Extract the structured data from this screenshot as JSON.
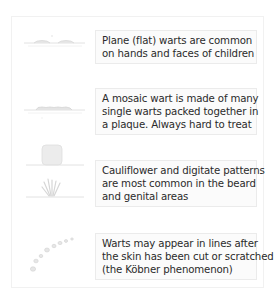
{
  "diagram": {
    "rows": [
      {
        "illustration": "plane-wart-icon",
        "lines": [
          "Plane (flat) warts are common",
          "on hands and faces of children"
        ]
      },
      {
        "illustration": "mosaic-wart-icon",
        "lines": [
          "A mosaic wart is made of many",
          "single warts packed together in",
          "a plaque. Always hard to treat"
        ]
      },
      {
        "illustration": "cauliflower-digitate-wart-icon",
        "lines": [
          "Cauliflower and digitate patterns",
          "are most common in the beard",
          "and genital areas"
        ]
      },
      {
        "illustration": "koebner-linear-warts-icon",
        "lines": [
          "Warts may appear in lines after",
          "the skin has been cut or scratched",
          "(the Köbner phenomenon)"
        ]
      }
    ],
    "colors": {
      "caption_bg": "#fbfbfb",
      "caption_border": "#ebebeb",
      "text": "#2a2a2a",
      "illustration": "#dcdcdc"
    }
  }
}
